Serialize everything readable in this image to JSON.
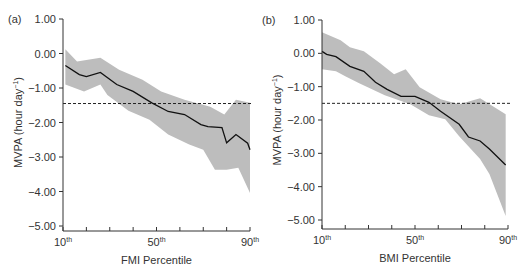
{
  "chart_data": [
    {
      "panel_label": "(a)",
      "type": "line",
      "title": "",
      "xlabel": "FMI Percentile",
      "ylabel": "MVPA (hour day⁻¹)",
      "xlim": [
        10,
        90
      ],
      "ylim": [
        -5,
        1
      ],
      "yticks": [
        1,
        0,
        -1,
        -2,
        -3,
        -4,
        -5
      ],
      "ytick_labels": [
        "1.00",
        "0.00",
        "−1.00",
        "−2.00",
        "−3.00",
        "−4.00",
        "−5.00"
      ],
      "xticks": [
        10,
        20,
        30,
        40,
        50,
        60,
        70,
        80,
        90
      ],
      "xtick_labels": [
        {
          "pos": 10,
          "num": "10",
          "sup": "th"
        },
        {
          "pos": 50,
          "num": "50",
          "sup": "th"
        },
        {
          "pos": 90,
          "num": "90",
          "sup": "th"
        }
      ],
      "grid": false,
      "reference_line": {
        "y": -1.45,
        "style": "dashed"
      },
      "series": [
        {
          "name": "estimate",
          "x": [
            11,
            17,
            20,
            26,
            33,
            40,
            48,
            55,
            62,
            69,
            72,
            78,
            80,
            84,
            89,
            90
          ],
          "y": [
            -0.35,
            -0.61,
            -0.67,
            -0.55,
            -0.9,
            -1.1,
            -1.43,
            -1.68,
            -1.77,
            -2.06,
            -2.12,
            -2.15,
            -2.59,
            -2.35,
            -2.6,
            -2.79
          ]
        },
        {
          "name": "ci_upper",
          "x": [
            11,
            16,
            26,
            34,
            44,
            52,
            62,
            73,
            79,
            84,
            90
          ],
          "y": [
            0.12,
            -0.23,
            -0.12,
            -0.47,
            -0.76,
            -1.1,
            -1.34,
            -1.54,
            -1.77,
            -1.34,
            -1.43
          ]
        },
        {
          "name": "ci_lower",
          "x": [
            11,
            19,
            26,
            29,
            38,
            47,
            55,
            64,
            70,
            75,
            80,
            85,
            90
          ],
          "y": [
            -0.9,
            -1.1,
            -0.9,
            -1.2,
            -1.66,
            -1.92,
            -2.35,
            -2.64,
            -2.79,
            -3.37,
            -3.37,
            -3.31,
            -4.04
          ]
        }
      ]
    },
    {
      "panel_label": "(b)",
      "type": "line",
      "title": "",
      "xlabel": "BMI Percentile",
      "ylabel": "MVPA (hour day⁻¹)",
      "xlim": [
        10,
        90
      ],
      "ylim": [
        -5,
        1
      ],
      "yticks": [
        1,
        0,
        -1,
        -2,
        -3,
        -4,
        -5
      ],
      "ytick_labels": [
        "1.00",
        "0.00",
        "−1.00",
        "−2.00",
        "−3.00",
        "−4.00",
        "−5.00"
      ],
      "xticks": [
        10,
        20,
        30,
        40,
        50,
        60,
        70,
        80,
        90
      ],
      "xtick_labels": [
        {
          "pos": 10,
          "num": "10",
          "sup": "th"
        },
        {
          "pos": 50,
          "num": "50",
          "sup": "th"
        },
        {
          "pos": 90,
          "num": "90",
          "sup": "th"
        }
      ],
      "grid": false,
      "reference_line": {
        "y": -1.5,
        "style": "dashed"
      },
      "series": [
        {
          "name": "estimate",
          "x": [
            10,
            12,
            16,
            22,
            28,
            33,
            38,
            44,
            50,
            56,
            61,
            69,
            73,
            78,
            82,
            89
          ],
          "y": [
            0.06,
            -0.03,
            -0.1,
            -0.39,
            -0.54,
            -0.87,
            -1.08,
            -1.29,
            -1.29,
            -1.47,
            -1.74,
            -2.13,
            -2.51,
            -2.63,
            -2.87,
            -3.35
          ]
        },
        {
          "name": "ci_upper",
          "x": [
            10,
            18,
            22,
            28,
            35,
            41,
            46,
            52,
            61,
            69,
            78,
            89
          ],
          "y": [
            0.63,
            0.39,
            0.18,
            0.06,
            -0.3,
            -0.63,
            -0.48,
            -1.02,
            -1.38,
            -1.53,
            -1.35,
            -1.83
          ]
        },
        {
          "name": "ci_lower",
          "x": [
            10,
            16,
            20,
            26,
            37,
            48,
            56,
            63,
            69,
            78,
            82,
            89
          ],
          "y": [
            -0.48,
            -0.54,
            -0.69,
            -0.9,
            -1.26,
            -1.53,
            -1.86,
            -1.98,
            -2.49,
            -3.17,
            -3.62,
            -4.88
          ]
        }
      ]
    }
  ],
  "panels": [
    {
      "label": "(a)",
      "xlabel": "FMI Percentile",
      "ylabel_main": "MVPA (hour day",
      "ylabel_sup": "−1",
      "ylabel_close": ")"
    },
    {
      "label": "(b)",
      "xlabel": "BMI Percentile",
      "ylabel_main": "MVPA (hour day",
      "ylabel_sup": "−1",
      "ylabel_close": ")"
    }
  ]
}
